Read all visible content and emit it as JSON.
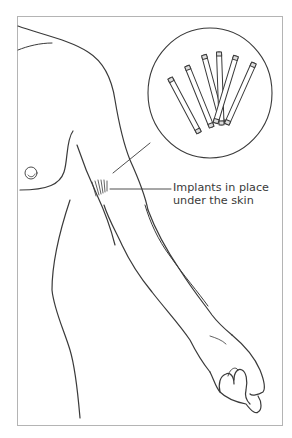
{
  "figure": {
    "callout_label_line1": "Implants in place",
    "callout_label_line2": "under the skin",
    "implant_count": 6,
    "colors": {
      "line": "#3a3a3a",
      "frame": "#b4b4b4",
      "background": "#ffffff"
    }
  }
}
